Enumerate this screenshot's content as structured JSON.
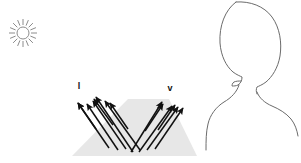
{
  "figure": {
    "background_color": "#ffffff"
  },
  "light_source": {
    "icon": "sun-icon",
    "center_x": 23,
    "center_y": 33,
    "core_radius": 6,
    "ray_count": 16,
    "ray_inner": 8,
    "ray_outer": 14,
    "stroke_color": "#8c8c8c"
  },
  "surface": {
    "name": "gray-trapezoid-surface",
    "fill_color": "#e7e7e7",
    "points": "128,99 169,99 197,156 72,156"
  },
  "labels": {
    "incident": "l",
    "view": "v",
    "incident_x": 79,
    "incident_y": 89,
    "view_x": 170,
    "view_y": 91
  },
  "arrow_color": "#111111",
  "incident_arrows": [
    {
      "x1": 109,
      "y1": 148,
      "x2": 78,
      "y2": 103
    },
    {
      "x1": 118,
      "y1": 150,
      "x2": 87,
      "y2": 104
    },
    {
      "x1": 126,
      "y1": 149,
      "x2": 93,
      "y2": 101
    },
    {
      "x1": 133,
      "y1": 152,
      "x2": 96,
      "y2": 97
    },
    {
      "x1": 140,
      "y1": 150,
      "x2": 105,
      "y2": 101
    }
  ],
  "short_incident_arrows": [
    {
      "x1": 96,
      "y1": 129,
      "x2": 78,
      "y2": 103
    },
    {
      "x1": 113,
      "y1": 125,
      "x2": 94,
      "y2": 99
    },
    {
      "x1": 128,
      "y1": 129,
      "x2": 110,
      "y2": 103
    }
  ],
  "view_arrows": [
    {
      "x1": 131,
      "y1": 152,
      "x2": 162,
      "y2": 102
    },
    {
      "x1": 139,
      "y1": 152,
      "x2": 172,
      "y2": 106
    },
    {
      "x1": 147,
      "y1": 150,
      "x2": 178,
      "y2": 107
    },
    {
      "x1": 155,
      "y1": 149,
      "x2": 183,
      "y2": 108
    }
  ],
  "short_view_arrows": [
    {
      "x1": 145,
      "y1": 131,
      "x2": 163,
      "y2": 104
    },
    {
      "x1": 158,
      "y1": 130,
      "x2": 175,
      "y2": 105
    }
  ],
  "observer": {
    "name": "head-silhouette-outline",
    "stroke_color": "#6b6b6b",
    "stroke_width": 1,
    "head_path": "M 236 2 C 225 10 219 26 220 43 C 221 56 226 66 233 72 C 237 75 240 76 242 77 C 242 80 241 83 238 85 C 236 86 234 86 232 86 C 232 86 232 83 234 82 C 236 81 239 81 241 81",
    "head_right_path": "M 236 2 C 250 1 264 6 272 17 C 280 28 282 43 280 56 C 278 68 272 77 266 82 C 262 85 259 86 257 87 C 256 89 256 92 257 94",
    "neck_left_path": "M 239 85 C 237 92 231 98 224 102 C 216 107 210 115 208 124 C 206 132 206 141 206 150",
    "neck_right_path": "M 257 92 C 259 98 265 103 272 106 C 279 109 286 113 291 119 C 295 124 297 130 298 136"
  }
}
